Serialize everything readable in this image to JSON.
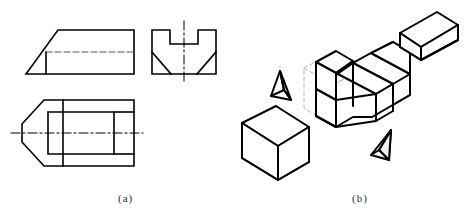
{
  "figure": {
    "background_color": "#ffffff",
    "line_color": "#000000",
    "construction_line_color": "#b0b0b0",
    "captions": [
      {
        "id": "a",
        "label": "(a)",
        "description": "Three orthographic projection views"
      },
      {
        "id": "b",
        "label": "(b)",
        "description": "Exploded isometric pictorial of the part and removed material"
      }
    ]
  },
  "views": {
    "front": {
      "name": "front-view",
      "label": "front view",
      "outline_points": "26,74 58,30 134,30 134,74",
      "hidden_line": "label: dashed hidden edge, from 46,52 to 134,52",
      "vertical_edge": "from 46,52 to 46,74",
      "line_style": "solid with one dashed hidden line"
    },
    "side": {
      "name": "side-view",
      "label": "left side view",
      "outline_points": "152,30 152,74 216,74 216,30 198,30 198,44 170,44 170,30",
      "chamfer_left": "from 152,52 to 170,74",
      "chamfer_right": "from 216,52 to 198,74",
      "center_line": "vertical dash-dot at x=184 from y=22 to y=82",
      "line_style": "solid outline with chamfer diagonals and center line"
    },
    "top": {
      "name": "top-view",
      "label": "top view",
      "outline_points": "22,130 44,100 134,100 134,166 44,166",
      "inner_rect": "from 48,112 to 114,154",
      "vertical_divider": "x=63 from y=100 to y=166",
      "center_line": "horizontal dash-dot at y=133 from x=12 to x=142",
      "line_style": "solid outline with interior rectangle and center line"
    }
  },
  "isometric": {
    "name": "exploded-isometric",
    "parts": [
      {
        "id": "main-body",
        "label": "notched block body",
        "note": "block with U-shaped channel across the top"
      },
      {
        "id": "removed-bar",
        "label": "removed rectangular bar",
        "note": "prism lifted out of the channel, upper right"
      },
      {
        "id": "removed-cube",
        "label": "removed cube block",
        "note": "cube separated at lower left"
      },
      {
        "id": "wedge-left",
        "label": "removed chamfer wedge (left)",
        "note": "small tetrahedron"
      },
      {
        "id": "wedge-right",
        "label": "removed chamfer wedge (right)",
        "note": "small tetrahedron"
      },
      {
        "id": "stock-outline",
        "label": "original stock outline",
        "note": "light gray dashed construction box"
      }
    ]
  }
}
